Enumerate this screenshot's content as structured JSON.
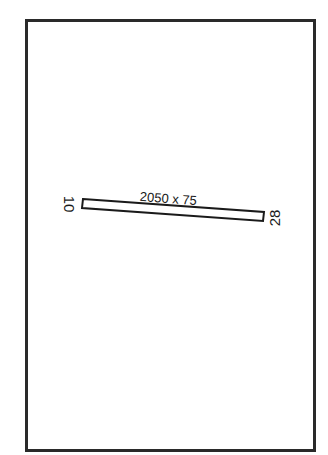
{
  "diagram": {
    "type": "airport-runway-diagram",
    "runway": {
      "dimensions_label": "2050 x 75",
      "end_left": "10",
      "end_right": "28"
    },
    "colors": {
      "stroke": "#1a1a1a",
      "background": "#ffffff"
    }
  }
}
